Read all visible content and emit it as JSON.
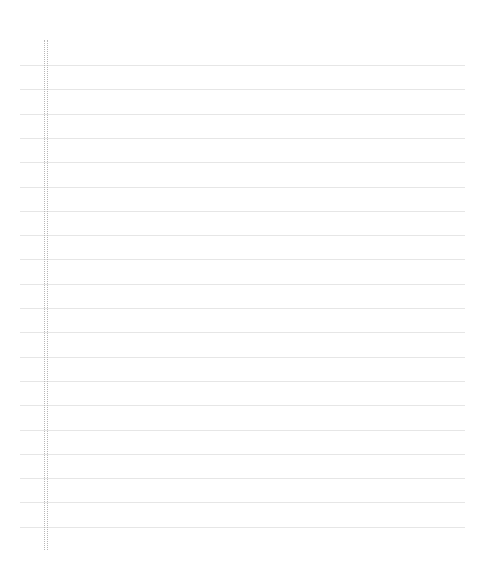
{
  "paper": {
    "type": "lined-notebook-paper",
    "background": "#ffffff",
    "rule_color": "#e6e6e6",
    "margin_color": "#b8b8b8",
    "margin": {
      "x_positions": [
        44,
        47
      ],
      "top": 40,
      "bottom": 550
    },
    "rules": {
      "count": 20,
      "first_y": 65,
      "spacing": 24.3,
      "left": 20,
      "right": 465
    }
  }
}
